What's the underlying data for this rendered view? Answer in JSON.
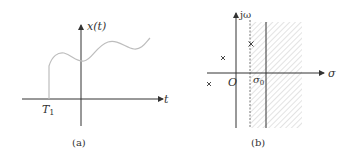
{
  "figure_a": {
    "caption": "(a)",
    "y_axis_label": "x(t)",
    "x_axis_label": "t",
    "marker_label": "T",
    "marker_sub": "1"
  },
  "figure_b": {
    "caption": "(b)",
    "y_axis_label": "jω",
    "x_axis_label": "σ",
    "origin_label": "O",
    "sigma0_label": "σ",
    "sigma0_sub": "0",
    "poles": 3,
    "region": "hatched right half-plane Re(s) > σ0"
  },
  "colors": {
    "axis": "#333333",
    "curve": "#bdbdbd",
    "hatch": "#c8c8c8",
    "dashed": "#777777"
  }
}
